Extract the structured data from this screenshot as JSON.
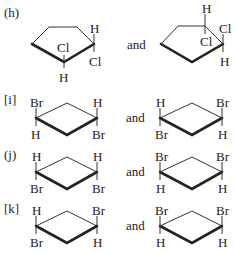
{
  "problems": [
    {
      "label": "(h)",
      "connector": "and",
      "left": {
        "ring": "cyclopentane",
        "atoms": [
          "H",
          "Cl",
          "H",
          "Cl"
        ]
      },
      "right": {
        "ring": "cyclopentane",
        "atoms": [
          "H",
          "Cl",
          "Cl",
          "H"
        ]
      }
    },
    {
      "label": "[i]",
      "connector": "and",
      "left": {
        "ring": "cyclohexane",
        "atoms": [
          "Br",
          "H",
          "H",
          "Br"
        ]
      },
      "right": {
        "ring": "cyclohexane",
        "atoms": [
          "H",
          "Br",
          "Br",
          "H"
        ]
      }
    },
    {
      "label": "(j)",
      "connector": "and",
      "left": {
        "ring": "cyclohexane",
        "atoms": [
          "H",
          "Br",
          "H",
          "Br"
        ]
      },
      "right": {
        "ring": "cyclohexane",
        "atoms": [
          "Br",
          "H",
          "Br",
          "H"
        ]
      }
    },
    {
      "label": "[k]",
      "connector": "and",
      "left": {
        "ring": "cyclohexane",
        "atoms": [
          "H",
          "Br",
          "Br",
          "H"
        ]
      },
      "right": {
        "ring": "cyclohexane",
        "atoms": [
          "Br",
          "H",
          "Br",
          "H"
        ]
      }
    }
  ]
}
